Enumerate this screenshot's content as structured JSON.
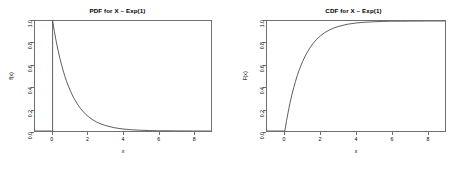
{
  "figure": {
    "background": "#ffffff",
    "axis_color": "#6f6f6f",
    "curve_color": "#4d4d4d"
  },
  "chart_data": [
    {
      "type": "line",
      "title": "PDF for X ~ Exp(1)",
      "xlabel": "x",
      "ylabel": "f(x)",
      "xlim": [
        -1,
        9
      ],
      "ylim": [
        0.0,
        1.0
      ],
      "grid": false,
      "legend": null,
      "xticks": [
        0,
        2,
        4,
        6,
        8
      ],
      "xticklabels": [
        "0",
        "2",
        "4",
        "6",
        "8"
      ],
      "yticks": [
        0.0,
        0.2,
        0.4,
        0.6,
        0.8,
        1.0
      ],
      "yticklabels": [
        "0.0",
        "0.2",
        "0.4",
        "0.6",
        "0.8",
        "1.0"
      ],
      "series": [
        {
          "name": "f(x) = exp(-x)",
          "x": [
            -1.0,
            -0.8,
            -0.6,
            -0.4,
            -0.2,
            -0.05,
            0.0,
            0.0,
            0.1,
            0.2,
            0.3,
            0.4,
            0.5,
            0.6,
            0.7,
            0.8,
            0.9,
            1.0,
            1.2,
            1.4,
            1.6,
            1.8,
            2.0,
            2.25,
            2.5,
            2.75,
            3.0,
            3.5,
            4.0,
            4.5,
            5.0,
            5.5,
            6.0,
            6.5,
            7.0,
            7.5,
            8.0,
            8.5,
            9.0
          ],
          "y": [
            0.0,
            0.0,
            0.0,
            0.0,
            0.0,
            0.0,
            0.0,
            1.0,
            0.905,
            0.819,
            0.741,
            0.67,
            0.607,
            0.549,
            0.497,
            0.449,
            0.407,
            0.368,
            0.301,
            0.247,
            0.202,
            0.165,
            0.135,
            0.105,
            0.082,
            0.064,
            0.05,
            0.03,
            0.018,
            0.011,
            0.007,
            0.004,
            0.002,
            0.002,
            0.001,
            0.001,
            0.0,
            0.0,
            0.0
          ]
        }
      ]
    },
    {
      "type": "line",
      "title": "CDF for X ~ Exp(1)",
      "xlabel": "x",
      "ylabel": "F(x)",
      "xlim": [
        -1,
        9
      ],
      "ylim": [
        0.0,
        1.0
      ],
      "grid": false,
      "legend": null,
      "xticks": [
        0,
        2,
        4,
        6,
        8
      ],
      "xticklabels": [
        "0",
        "2",
        "4",
        "6",
        "8"
      ],
      "yticks": [
        0.0,
        0.2,
        0.4,
        0.6,
        0.8,
        1.0
      ],
      "yticklabels": [
        "0.0",
        "0.2",
        "0.4",
        "0.6",
        "0.8",
        "1.0"
      ],
      "series": [
        {
          "name": "F(x) = 1 - exp(-x)",
          "x": [
            -1.0,
            -0.8,
            -0.6,
            -0.4,
            -0.2,
            -0.05,
            0.0,
            0.1,
            0.2,
            0.3,
            0.4,
            0.5,
            0.6,
            0.7,
            0.8,
            0.9,
            1.0,
            1.2,
            1.4,
            1.6,
            1.8,
            2.0,
            2.25,
            2.5,
            2.75,
            3.0,
            3.5,
            4.0,
            4.5,
            5.0,
            5.5,
            6.0,
            6.5,
            7.0,
            7.5,
            8.0,
            8.5,
            9.0
          ],
          "y": [
            0.0,
            0.0,
            0.0,
            0.0,
            0.0,
            0.0,
            0.0,
            0.095,
            0.181,
            0.259,
            0.33,
            0.393,
            0.451,
            0.503,
            0.551,
            0.593,
            0.632,
            0.699,
            0.753,
            0.798,
            0.835,
            0.865,
            0.895,
            0.918,
            0.936,
            0.95,
            0.97,
            0.982,
            0.989,
            0.993,
            0.996,
            0.998,
            0.998,
            0.999,
            0.999,
            1.0,
            1.0,
            1.0
          ]
        }
      ]
    }
  ]
}
